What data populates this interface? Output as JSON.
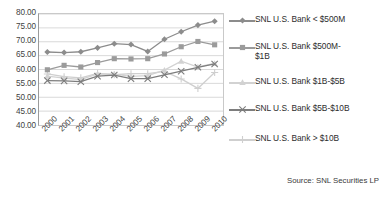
{
  "chart_data": {
    "type": "line",
    "title": "",
    "xlabel": "",
    "ylabel": "",
    "ylim": [
      40.0,
      80.0
    ],
    "ytick_step": 5.0,
    "grid": true,
    "legend_position": "right",
    "categories": [
      "2000",
      "2001",
      "2002",
      "2003",
      "2004",
      "2005",
      "2006",
      "2007",
      "2008",
      "2009",
      "2010"
    ],
    "ytick_labels": [
      "80.00",
      "75.00",
      "70.00",
      "65.00",
      "60.00",
      "55.00",
      "50.00",
      "45.00",
      "40.00"
    ],
    "ytick_values": [
      80.0,
      75.0,
      70.0,
      65.0,
      60.0,
      55.0,
      50.0,
      45.0,
      40.0
    ],
    "series": [
      {
        "name": "SNL U.S. Bank < $500M",
        "marker": "diamond",
        "color": "#8c8c8c",
        "values": [
          66.3,
          66.1,
          66.4,
          67.8,
          69.3,
          69.0,
          66.5,
          70.9,
          73.6,
          76.0,
          77.4
        ]
      },
      {
        "name": "SNL U.S. Bank $500M-\n$1B",
        "marker": "square",
        "color": "#9b9b9b",
        "values": [
          59.9,
          61.5,
          60.9,
          62.5,
          63.9,
          63.8,
          63.9,
          65.6,
          68.2,
          70.1,
          68.9
        ]
      },
      {
        "name": "SNL U.S. Bank $1B-$5B",
        "marker": "triangle",
        "color": "#d2d2d2",
        "values": [
          57.6,
          56.9,
          56.4,
          58.4,
          58.3,
          57.5,
          57.8,
          59.8,
          63.0,
          60.9,
          62.2
        ]
      },
      {
        "name": "SNL U.S. Bank $5B-$10B",
        "marker": "cross",
        "color": "#7d7d7d",
        "values": [
          56.0,
          55.9,
          55.6,
          57.6,
          58.0,
          56.7,
          56.7,
          58.1,
          59.4,
          60.8,
          62.0
        ]
      },
      {
        "name": "SNL U.S. Bank > $10B",
        "marker": "dash",
        "color": "#cfcfcf",
        "values": [
          58.4,
          57.4,
          57.0,
          58.6,
          58.1,
          58.5,
          58.5,
          59.3,
          56.6,
          53.2,
          58.9
        ]
      }
    ]
  },
  "source": {
    "text": "Source: SNL Securities LP"
  }
}
